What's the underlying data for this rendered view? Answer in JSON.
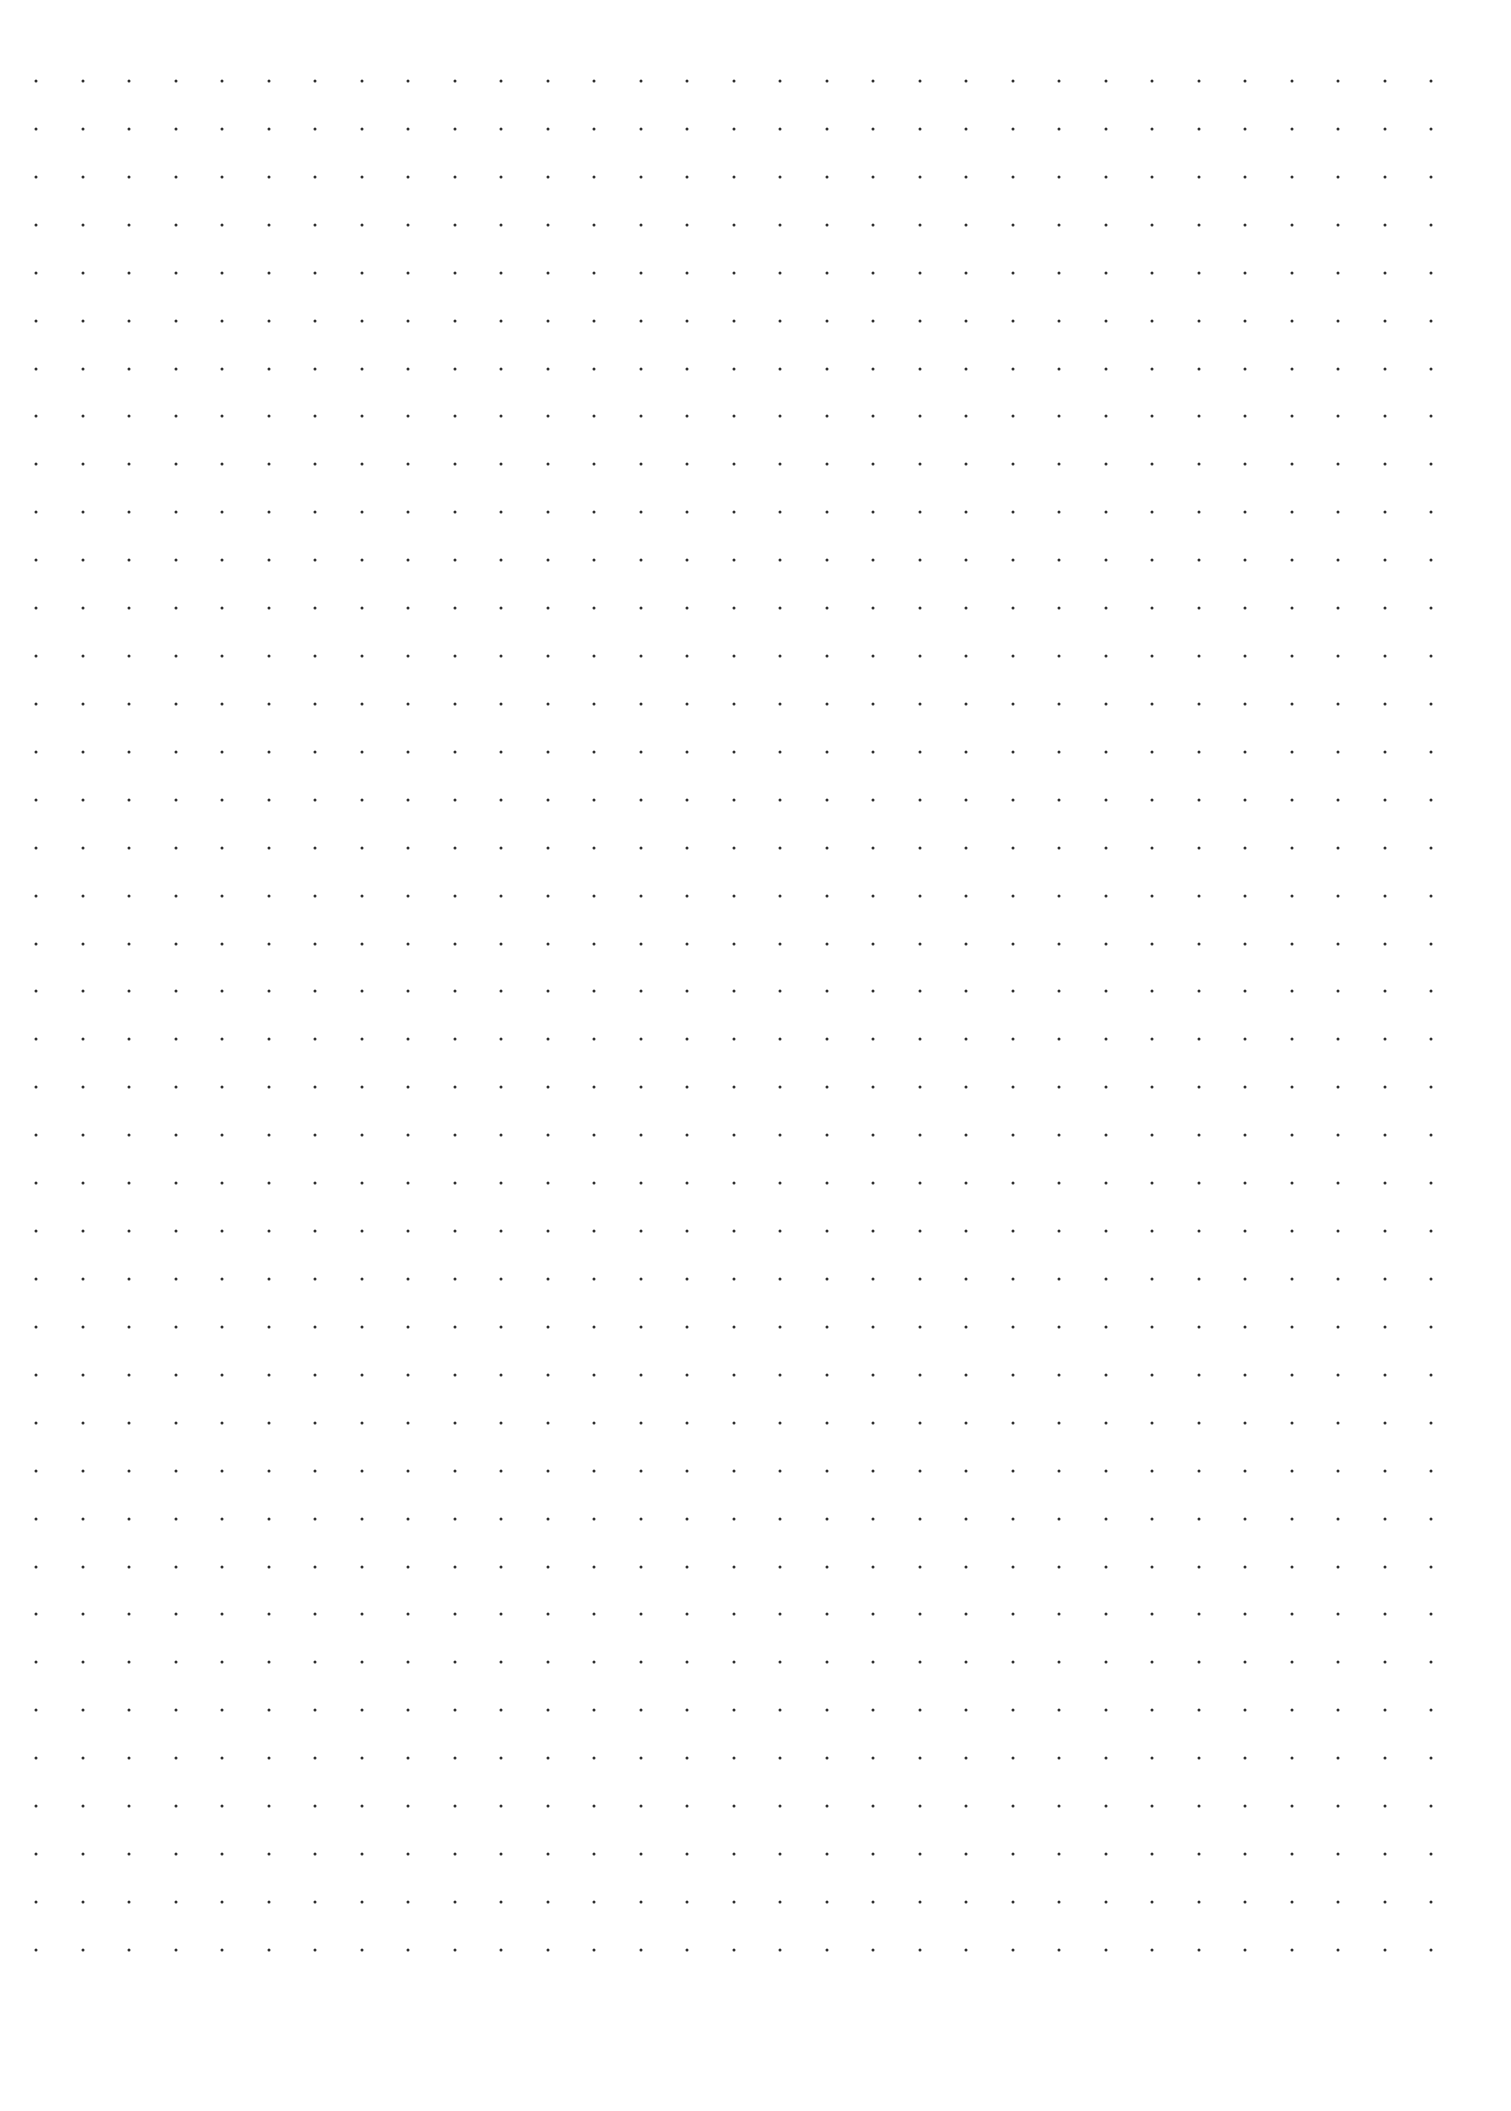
{
  "page": {
    "type": "dot-grid-paper",
    "background_color": "#ffffff"
  },
  "grid": {
    "columns": 31,
    "rows": 40,
    "origin_x": 36,
    "origin_y": 81,
    "spacing_x": 46.5,
    "spacing_y": 47.92,
    "dot_size": 3,
    "dot_color": "#2e2e2e"
  }
}
